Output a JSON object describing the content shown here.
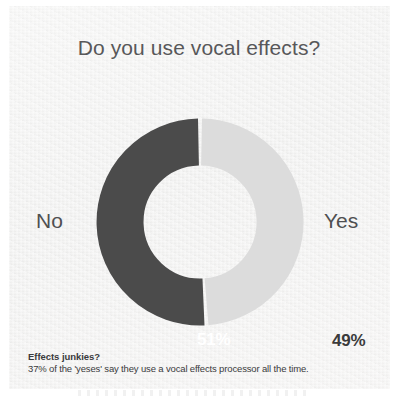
{
  "chart_data": {
    "type": "pie",
    "variant": "donut",
    "title": "Do you use vocal effects?",
    "categories": [
      "No",
      "Yes"
    ],
    "values": [
      51,
      49
    ],
    "value_labels": [
      "51%",
      "49%"
    ],
    "unit": "%",
    "colors": [
      "#4b4b4b",
      "#dcdcdc"
    ],
    "legend": "inline-side-labels",
    "grid": false,
    "start_angle_deg": 0,
    "slices": [
      {
        "label": "No",
        "value": 51,
        "display": "51%",
        "color": "#4b4b4b",
        "label_color": "#ffffff"
      },
      {
        "label": "Yes",
        "value": 49,
        "display": "49%",
        "color": "#dcdcdc",
        "label_color": "#3b3b3b"
      }
    ]
  },
  "title": "Do you use vocal effects?",
  "caption": {
    "heading": "Effects junkies?",
    "body": "37% of the 'yeses' say they use a vocal effects processor all the time."
  },
  "colors": {
    "no_slice": "#4b4b4b",
    "yes_slice": "#dcdcdc",
    "panel_background": "#f2f2f1",
    "title_text": "#58585a",
    "caption_text": "#3a3a3c"
  }
}
